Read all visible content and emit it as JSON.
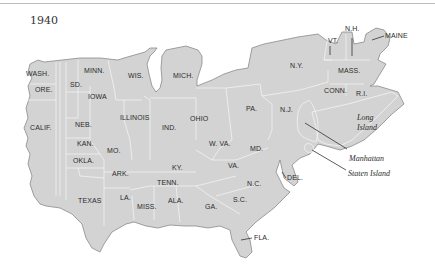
{
  "title": "1940",
  "colors": {
    "land": "#d3d3d3",
    "borders": "#f2f2f2",
    "coast": "#8a8a8a",
    "text": "#2b2b2b"
  },
  "states": [
    {
      "label": "WASH.",
      "x": 26,
      "y": 76
    },
    {
      "label": "ORE.",
      "x": 35,
      "y": 92
    },
    {
      "label": "CALIF.",
      "x": 30,
      "y": 130
    },
    {
      "label": "SD.",
      "x": 70,
      "y": 87
    },
    {
      "label": "MINN.",
      "x": 84,
      "y": 73
    },
    {
      "label": "IOWA",
      "x": 88,
      "y": 99
    },
    {
      "label": "WIS.",
      "x": 128,
      "y": 78
    },
    {
      "label": "MICH.",
      "x": 173,
      "y": 78
    },
    {
      "label": "NEB.",
      "x": 75,
      "y": 127
    },
    {
      "label": "KAN.",
      "x": 77,
      "y": 146
    },
    {
      "label": "OKLA.",
      "x": 73,
      "y": 163
    },
    {
      "label": "MO.",
      "x": 107,
      "y": 153
    },
    {
      "label": "ILLINOIS",
      "x": 122,
      "y": 120
    },
    {
      "label": "IND.",
      "x": 162,
      "y": 130
    },
    {
      "label": "OHIO",
      "x": 190,
      "y": 121
    },
    {
      "label": "ARK.",
      "x": 112,
      "y": 176
    },
    {
      "label": "TEXAS",
      "x": 78,
      "y": 203
    },
    {
      "label": "LA.",
      "x": 120,
      "y": 200
    },
    {
      "label": "MISS.",
      "x": 137,
      "y": 209
    },
    {
      "label": "ALA.",
      "x": 168,
      "y": 203
    },
    {
      "label": "KY.",
      "x": 172,
      "y": 170
    },
    {
      "label": "TENN.",
      "x": 158,
      "y": 185
    },
    {
      "label": "W. VA.",
      "x": 211,
      "y": 146
    },
    {
      "label": "VA.",
      "x": 228,
      "y": 168
    },
    {
      "label": "GA.",
      "x": 205,
      "y": 209
    },
    {
      "label": "S.C.",
      "x": 233,
      "y": 202
    },
    {
      "label": "N.C.",
      "x": 247,
      "y": 186
    },
    {
      "label": "MD.",
      "x": 251,
      "y": 151
    },
    {
      "label": "PA.",
      "x": 246,
      "y": 111
    },
    {
      "label": "N.J.",
      "x": 280,
      "y": 112
    },
    {
      "label": "N.Y.",
      "x": 290,
      "y": 68
    },
    {
      "label": "MASS.",
      "x": 340,
      "y": 73
    },
    {
      "label": "CONN.",
      "x": 325,
      "y": 93
    },
    {
      "label": "R.I.",
      "x": 355,
      "y": 96
    },
    {
      "label": "VT.",
      "x": 330,
      "y": 42
    },
    {
      "label": "N.H.",
      "x": 347,
      "y": 30
    },
    {
      "label": "MAINE",
      "x": 385,
      "y": 38
    },
    {
      "label": "DEL.",
      "x": 288,
      "y": 178
    },
    {
      "label": "FLA.",
      "x": 255,
      "y": 238
    }
  ],
  "annotations": [
    {
      "label": "Long",
      "x": 356,
      "y": 121
    },
    {
      "label": "Island",
      "x": 356,
      "y": 131
    },
    {
      "label": "Manhattan",
      "x": 350,
      "y": 160
    },
    {
      "label": "Staten Island",
      "x": 349,
      "y": 175
    }
  ]
}
